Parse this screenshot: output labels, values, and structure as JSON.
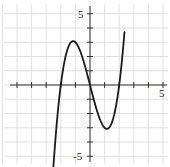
{
  "chart_data": {
    "type": "line",
    "title": "",
    "xlabel": "",
    "ylabel": "",
    "xlim": [
      -5,
      5
    ],
    "ylim": [
      -5,
      5
    ],
    "grid": true,
    "tick_labels": {
      "x": [
        "5"
      ],
      "y": [
        "5",
        "-5"
      ]
    },
    "series": [
      {
        "name": "f(x)",
        "description": "cubic with roots at x=-2, 0, 2; local max (-1, 3); local min (1, -3)",
        "x": [
          -2.45,
          -2.3,
          -2.0,
          -1.6,
          -1.2,
          -1.0,
          -0.6,
          -0.3,
          0.0,
          0.3,
          0.6,
          1.0,
          1.2,
          1.6,
          2.0,
          2.2,
          2.35
        ],
        "y": [
          -4.9,
          -2.97,
          0.0,
          2.3,
          3.07,
          3.0,
          2.18,
          1.17,
          0.0,
          -1.17,
          -2.18,
          -3.0,
          -3.07,
          -2.3,
          0.0,
          1.85,
          3.58
        ]
      }
    ],
    "endpoints": {
      "start": [
        -2.7,
        -5.3
      ],
      "end": [
        2.35,
        5.2
      ]
    }
  },
  "labels": {
    "x_max": "5",
    "y_max": "5",
    "y_min": "-5"
  },
  "colors": {
    "curve": "#1a1a1a",
    "axis": "#333333",
    "grid": "#d9d9d9"
  }
}
